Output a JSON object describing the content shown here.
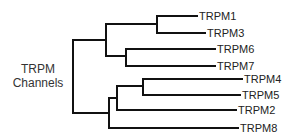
{
  "diagram": {
    "type": "phylogenetic-tree",
    "root_label_line1": "TRPM",
    "root_label_line2": "Channels",
    "leaves": [
      "TRPM1",
      "TRPM3",
      "TRPM6",
      "TRPM7",
      "TRPM4",
      "TRPM5",
      "TRPM2",
      "TRPM8"
    ],
    "line_color": "#111111",
    "tree": "((TRPM1,TRPM3),(TRPM6,TRPM7)),(((TRPM4,TRPM5),TRPM2),TRPM8)"
  }
}
